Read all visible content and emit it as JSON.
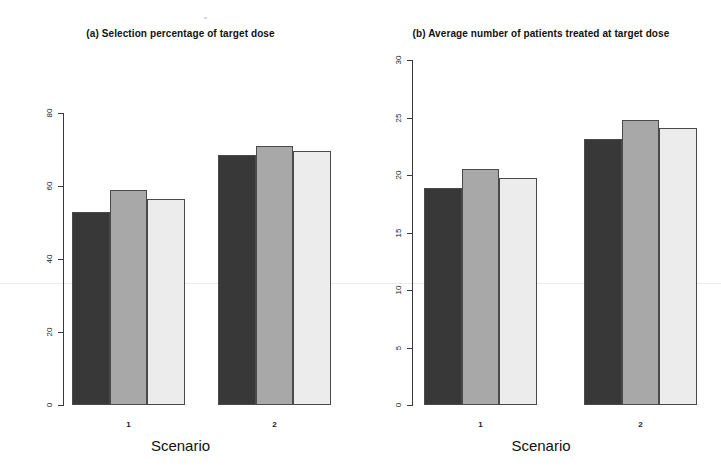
{
  "figure": {
    "width": 721,
    "height": 473,
    "background": "#ffffff",
    "series_colors": [
      "#383838",
      "#a8a8a8",
      "#ececec"
    ]
  },
  "panels": [
    {
      "id": "panel-a",
      "title": "(a) Selection percentage of target dose",
      "xlabel": "Scenario"
    },
    {
      "id": "panel-b",
      "title": "(b) Average number of patients treated at target dose",
      "xlabel": "Scenario"
    }
  ],
  "chart_data": [
    {
      "type": "bar",
      "title": "(a) Selection percentage of target dose",
      "xlabel": "Scenario",
      "ylabel": "",
      "categories": [
        "1",
        "2"
      ],
      "series": [
        {
          "name": "Method 1",
          "color": "#383838",
          "values": [
            53,
            68.5
          ]
        },
        {
          "name": "Method 2",
          "color": "#a8a8a8",
          "values": [
            59,
            71
          ]
        },
        {
          "name": "Method 3",
          "color": "#ececec",
          "values": [
            56.5,
            69.5
          ]
        }
      ],
      "ylim": [
        0,
        80
      ],
      "yticks": [
        0,
        20,
        40,
        60,
        80
      ],
      "ytick_labels": [
        "0",
        "20",
        "40",
        "60",
        "80"
      ],
      "grid": false,
      "legend": "none"
    },
    {
      "type": "bar",
      "title": "(b) Average number of patients treated at target dose",
      "xlabel": "Scenario",
      "ylabel": "",
      "categories": [
        "1",
        "2"
      ],
      "series": [
        {
          "name": "Method 1",
          "color": "#383838",
          "values": [
            18.9,
            23.1
          ]
        },
        {
          "name": "Method 2",
          "color": "#a8a8a8",
          "values": [
            20.5,
            24.8
          ]
        },
        {
          "name": "Method 3",
          "color": "#ececec",
          "values": [
            19.7,
            24.1
          ]
        }
      ],
      "ylim": [
        0,
        30
      ],
      "yticks": [
        0,
        5,
        10,
        15,
        20,
        25,
        30
      ],
      "ytick_labels": [
        "0",
        "5",
        "10",
        "15",
        "20",
        "25",
        "30"
      ],
      "grid": false,
      "legend": "none"
    }
  ]
}
